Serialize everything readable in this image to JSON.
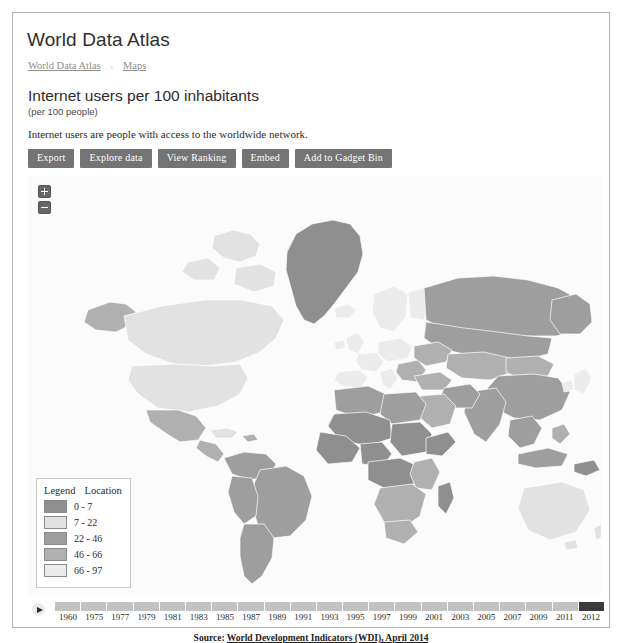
{
  "header": {
    "app_title": "World Data Atlas"
  },
  "breadcrumb": {
    "items": [
      "World Data Atlas",
      "Maps"
    ],
    "separator": "›"
  },
  "indicator": {
    "title": "Internet users per 100 inhabitants",
    "subtitle": "(per 100 people)",
    "description": "Internet users are people with access to the worldwide network."
  },
  "toolbar": {
    "buttons": [
      {
        "label": "Export",
        "name": "export-button"
      },
      {
        "label": "Explore data",
        "name": "explore-data-button"
      },
      {
        "label": "View Ranking",
        "name": "view-ranking-button"
      },
      {
        "label": "Embed",
        "name": "embed-button"
      },
      {
        "label": "Add to Gadget Bin",
        "name": "add-to-gadget-bin-button"
      }
    ]
  },
  "map": {
    "zoom_in_label": "+",
    "zoom_out_label": "−",
    "ocean_color": "#fbfbfb",
    "no_data_color": "#eaeaea",
    "border_color": "#ffffff"
  },
  "legend": {
    "header_left": "Legend",
    "header_right": "Location",
    "rows": [
      {
        "label": "0 - 7",
        "color": "#8f8f8f"
      },
      {
        "label": "7 - 22",
        "color": "#e2e2e2"
      },
      {
        "label": "22 - 46",
        "color": "#9e9e9e"
      },
      {
        "label": "46 - 66",
        "color": "#b0b0b0"
      },
      {
        "label": "66 - 97",
        "color": "#ececec"
      }
    ]
  },
  "timeline": {
    "play_label": "▶",
    "selected_year": "2012",
    "years": [
      "1960",
      "1975",
      "1977",
      "1979",
      "1981",
      "1983",
      "1985",
      "1987",
      "1989",
      "1991",
      "1993",
      "1995",
      "1997",
      "1999",
      "2001",
      "2003",
      "2005",
      "2007",
      "2009",
      "2011",
      "2012"
    ]
  },
  "source": {
    "prefix": "Source: ",
    "link": "World Development Indicators (WDI), April 2014"
  },
  "chart_data": {
    "type": "map",
    "title": "Internet users per 100 inhabitants",
    "unit": "per 100 people",
    "year": "2012",
    "color_scale": [
      "#8f8f8f",
      "#e2e2e2",
      "#9e9e9e",
      "#b0b0b0",
      "#ececec"
    ],
    "bins": [
      "0 - 7",
      "7 - 22",
      "22 - 46",
      "46 - 66",
      "66 - 97"
    ],
    "source": "World Development Indicators (WDI), April 2014"
  }
}
